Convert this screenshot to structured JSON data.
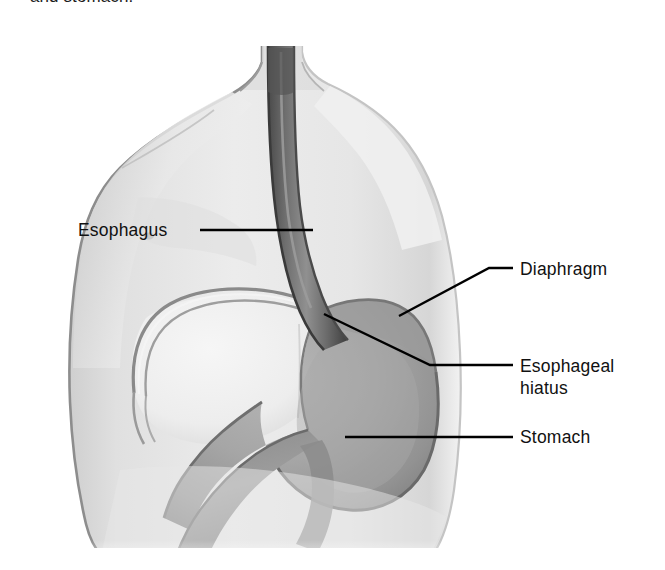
{
  "figure": {
    "caption_clipped_above": "preceding line clipped",
    "caption": "and stomach.",
    "background_color": "#ffffff"
  },
  "labels": [
    {
      "id": "esophagus",
      "text": "Esophagus",
      "text_x": 78,
      "text_y": 236,
      "anchor": "start",
      "leader": "M 200 230 L 313 230",
      "target": "esophagus tube in mid-chest"
    },
    {
      "id": "diaphragm",
      "text": "Diaphragm",
      "text_x": 520,
      "text_y": 275,
      "anchor": "start",
      "leader": "M 399 316 L 489 268 L 513 268",
      "target": "dome of the diaphragm"
    },
    {
      "id": "esophageal-hiatus-line1",
      "text": "Esophageal",
      "text_x": 520,
      "text_y": 372,
      "anchor": "start",
      "leader": "M 324 314 L 430 365 L 513 365",
      "target": "opening in diaphragm where esophagus passes"
    },
    {
      "id": "esophageal-hiatus-line2",
      "text": "hiatus",
      "text_x": 520,
      "text_y": 394,
      "anchor": "start",
      "leader": "",
      "target": ""
    },
    {
      "id": "stomach",
      "text": "Stomach",
      "text_x": 520,
      "text_y": 443,
      "anchor": "start",
      "leader": "M 345 437 L 513 437",
      "target": "body of the stomach"
    }
  ],
  "anatomy": {
    "torso_color": "#e4e4e4",
    "torso_edge_color": "#9a9a9a",
    "esophagus_color": "#6d6d6d",
    "esophagus_edge_color": "#3d3d3d",
    "stomach_color": "#a3a3a3",
    "stomach_edge_color": "#5f5f5f",
    "diaphragm_line_color": "#8d8d8d",
    "liver_color": "#efefef",
    "duodenum_color": "#8f8f8f",
    "parts": [
      "torso",
      "neck",
      "left-shoulder",
      "right-shoulder",
      "esophagus",
      "diaphragm-dome",
      "esophageal-hiatus",
      "stomach-fundus",
      "stomach-body",
      "pylorus",
      "duodenum",
      "liver-outline"
    ]
  }
}
